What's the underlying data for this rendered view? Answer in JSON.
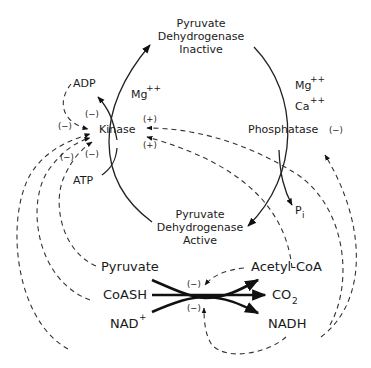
{
  "diagram": {
    "nodes": {
      "pdh_inactive": [
        "Pyruvate",
        "Dehydrogenase",
        "Inactive"
      ],
      "pdh_active": [
        "Pyruvate",
        "Dehydrogenase",
        "Active"
      ],
      "kinase": "Kinase",
      "phosphatase": "Phosphatase",
      "adp": "ADP",
      "atp": "ATP",
      "pi": "P",
      "pi_sub": "i",
      "mg_kinase": "Mg",
      "mg_kinase_sup": "++",
      "mg_phos": "Mg",
      "mg_phos_sup": "++",
      "ca_phos": "Ca",
      "ca_phos_sup": "++",
      "pyruvate": "Pyruvate",
      "coash": "CoASH",
      "nad": "NAD",
      "nad_sup": "+",
      "acetylcoa": "Acetyl-CoA",
      "co2": "CO",
      "co2_sub": "2",
      "nadh": "NADH"
    },
    "signs": {
      "kinase_top_inner": "(−)",
      "kinase_left_outer": "(−)",
      "kinase_bottom_inner": "(−)",
      "kinase_bottom_outer": "(−)",
      "kinase_plus_top": "(+)",
      "kinase_plus_bottom": "(+)",
      "phosphatase_minus": "(−)",
      "reaction_top": "(−)",
      "reaction_bottom": "(−)"
    }
  }
}
